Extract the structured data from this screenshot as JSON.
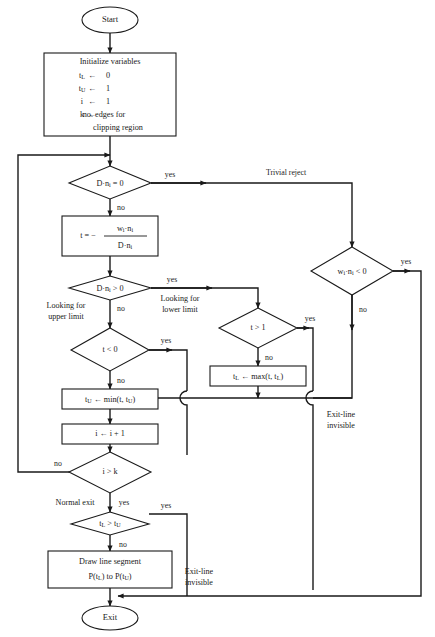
{
  "diagram": {
    "stroke_color": "#1a1a1a",
    "background_color": "#ffffff"
  },
  "nodes": {
    "start": {
      "label": "Start"
    },
    "exit": {
      "label": "Exit"
    },
    "initialize": {
      "heading": "Initialize variables",
      "lines": [
        {
          "var": "t",
          "sub": "L",
          "arrow": "←",
          "value": "0"
        },
        {
          "var": "t",
          "sub": "U",
          "arrow": "←",
          "value": "1"
        },
        {
          "var": "i",
          "sub": "",
          "arrow": "←",
          "value": "1"
        },
        {
          "var": "k",
          "sub": "",
          "arrow": "←",
          "value": "no. edges for"
        }
      ],
      "continuation": "clipping region"
    },
    "t_formula": {
      "lhs": "t = −",
      "numerator_a": "w",
      "numerator_sub_a": "i",
      "numerator_dot": "·",
      "numerator_b": "n",
      "numerator_sub_b": "i",
      "denominator_a": "D",
      "denominator_dot": "·",
      "denominator_b": "n",
      "denominator_sub_b": "i"
    },
    "d_dot_n_eq_zero": {
      "text": "D·n",
      "sub": "i",
      "tail": " = 0"
    },
    "d_dot_n_gt_zero": {
      "text": "D·n",
      "sub": "i",
      "tail": " > 0"
    },
    "w_dot_n_lt_zero": {
      "text": "w",
      "sub1": "i",
      "mid": "·n",
      "sub2": "i",
      "tail": " < 0"
    },
    "t_lt_zero": {
      "text": "t < 0"
    },
    "t_gt_one": {
      "text": "t > 1"
    },
    "i_gt_k": {
      "text": "i > k"
    },
    "tl_gt_tu": {
      "text": "t",
      "sub1": "L",
      "mid": " > t",
      "sub2": "U"
    },
    "tu_min": {
      "var": "t",
      "sub": "U",
      "arrow": "←",
      "expr": "min(t, t",
      "expr_sub": "U",
      "expr_tail": ")"
    },
    "tl_max": {
      "var": "t",
      "sub": "L",
      "arrow": "←",
      "expr": "max(t, t",
      "expr_sub": "L",
      "expr_tail": ")"
    },
    "i_increment": {
      "text": "i ← i + 1"
    },
    "draw_segment": {
      "line1": "Draw line segment",
      "line2_a": "P(t",
      "line2_sub_a": "L",
      "line2_mid": ") to P(t",
      "line2_sub_b": "U",
      "line2_tail": ")"
    }
  },
  "edge_labels": {
    "yes_trivial": "yes",
    "no_below_zero_test": "no",
    "trivial_reject": "Trivial reject",
    "yes_w_dot_n": "yes",
    "no_w_dot_n": "no",
    "yes_d_gt_zero": "yes",
    "no_d_gt_zero": "no",
    "looking_upper_1": "Looking for",
    "looking_upper_2": "upper limit",
    "looking_lower_1": "Looking for",
    "looking_lower_2": "lower limit",
    "yes_t_lt_zero": "yes",
    "no_t_lt_zero": "no",
    "yes_t_gt_one": "yes",
    "no_t_gt_one": "no",
    "no_i_gt_k": "no",
    "yes_i_gt_k": "yes",
    "normal_exit": "Normal exit",
    "yes_tl_gt_tu": "yes",
    "no_tl_gt_tu": "no",
    "exit_line_invisible_right_1": "Exit-line",
    "exit_line_invisible_right_2": "invisible",
    "exit_line_invisible_bottom_1": "Exit-line",
    "exit_line_invisible_bottom_2": "invisible"
  }
}
